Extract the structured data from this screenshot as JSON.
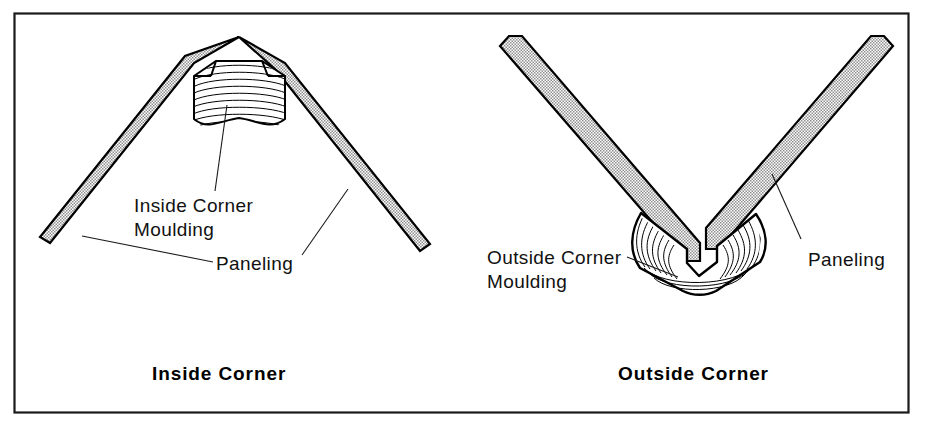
{
  "figure": {
    "background_color": "#ffffff",
    "frame_color": "#1a1a1a",
    "panel_fill_color": "#d5d5d5",
    "moulding_fill_color": "#ffffff",
    "line_color": "#000000"
  },
  "panels": [
    {
      "id": "inside-corner",
      "caption": "Inside Corner",
      "labels": [
        {
          "id": "inside-corner-moulding",
          "line1": "Inside Corner",
          "line2": "Moulding"
        },
        {
          "id": "paneling-left",
          "line1": "Paneling",
          "line2": ""
        }
      ],
      "parts": [
        {
          "name": "Paneling",
          "fill": "stipple-gray"
        },
        {
          "name": "Inside Corner Moulding",
          "fill": "wood-grain"
        }
      ]
    },
    {
      "id": "outside-corner",
      "caption": "Outside Corner",
      "labels": [
        {
          "id": "outside-corner-moulding",
          "line1": "Outside Corner",
          "line2": "Moulding"
        },
        {
          "id": "paneling-right",
          "line1": "Paneling",
          "line2": ""
        }
      ],
      "parts": [
        {
          "name": "Paneling",
          "fill": "stipple-gray"
        },
        {
          "name": "Outside Corner Moulding",
          "fill": "wood-grain"
        }
      ]
    }
  ]
}
